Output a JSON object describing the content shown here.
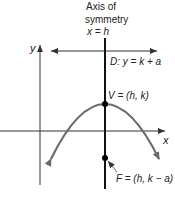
{
  "title": {
    "line1": "Axis of",
    "line2": "symmetry",
    "line3": "x = h"
  },
  "labels": {
    "y_axis": "y",
    "x_axis": "x",
    "directrix": "D: y = k + a",
    "vertex": "V = (h, k)",
    "focus": "F = (h, k − a)"
  },
  "colors": {
    "axis": "#333333",
    "symmetry_line": "#111111",
    "parabola": "#6b6b6b",
    "text": "#222222",
    "point": "#000000"
  }
}
